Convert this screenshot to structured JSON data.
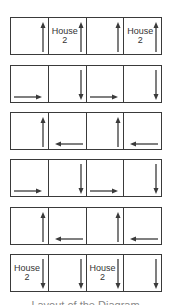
{
  "diagram": {
    "stroke_color": "#3a3a3a",
    "rows": [
      {
        "cells": [
          {
            "label": "",
            "arrow": "up"
          },
          {
            "label": "House\n2",
            "label_line1": "House",
            "label_line2": "2",
            "arrow": "up"
          },
          {
            "label": "",
            "arrow": "up"
          },
          {
            "label": "House\n2",
            "label_line1": "House",
            "label_line2": "2",
            "arrow": "up"
          }
        ]
      },
      {
        "cells": [
          {
            "label": "",
            "arrow": "right"
          },
          {
            "label": "",
            "arrow": "down"
          },
          {
            "label": "",
            "arrow": "right"
          },
          {
            "label": "",
            "arrow": "down"
          }
        ]
      },
      {
        "cells": [
          {
            "label": "",
            "arrow": "up"
          },
          {
            "label": "",
            "arrow": "left"
          },
          {
            "label": "",
            "arrow": "up"
          },
          {
            "label": "",
            "arrow": "left"
          }
        ]
      },
      {
        "cells": [
          {
            "label": "",
            "arrow": "right"
          },
          {
            "label": "",
            "arrow": "down"
          },
          {
            "label": "",
            "arrow": "right"
          },
          {
            "label": "",
            "arrow": "down"
          }
        ]
      },
      {
        "cells": [
          {
            "label": "",
            "arrow": "up"
          },
          {
            "label": "",
            "arrow": "left"
          },
          {
            "label": "",
            "arrow": "up"
          },
          {
            "label": "",
            "arrow": "left"
          }
        ]
      },
      {
        "cells": [
          {
            "label": "House\n2",
            "label_line1": "House",
            "label_line2": "2",
            "arrow": "down"
          },
          {
            "label": "",
            "arrow": "down"
          },
          {
            "label": "House\n2",
            "label_line1": "House",
            "label_line2": "2",
            "arrow": "down"
          },
          {
            "label": "",
            "arrow": "down"
          }
        ]
      }
    ],
    "caption": "Layout of the Diagram"
  }
}
